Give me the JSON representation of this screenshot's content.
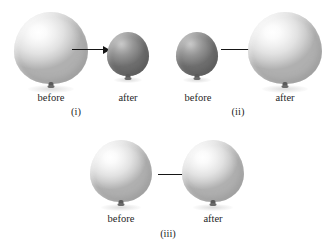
{
  "figure": {
    "background_color": "#ffffff",
    "balloon_light_color": "#e2e2e2",
    "balloon_dark_color": "#8a8a8a",
    "arrow_color": "#161616",
    "text_color": "#1f1f1f"
  },
  "panels": [
    {
      "id": "i",
      "caption": "(i)",
      "before": {
        "label": "before",
        "shade": "light",
        "width": 74,
        "height": 80
      },
      "after": {
        "label": "after",
        "shade": "dark",
        "width": 42,
        "height": 48
      }
    },
    {
      "id": "ii",
      "caption": "(ii)",
      "before": {
        "label": "before",
        "shade": "dark",
        "width": 42,
        "height": 48
      },
      "after": {
        "label": "after",
        "shade": "light",
        "width": 74,
        "height": 80
      }
    },
    {
      "id": "iii",
      "caption": "(iii)",
      "before": {
        "label": "before",
        "shade": "light",
        "width": 62,
        "height": 68
      },
      "after": {
        "label": "after",
        "shade": "light",
        "width": 62,
        "height": 68
      }
    }
  ]
}
